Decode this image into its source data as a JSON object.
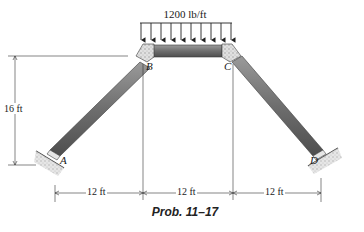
{
  "diagram": {
    "load": {
      "label": "1200 lb/ft",
      "arrow_count": 10
    },
    "points": {
      "A": "A",
      "B": "B",
      "C": "C",
      "D": "D"
    },
    "dimensions": {
      "height": "16 ft",
      "spans": [
        "12 ft",
        "12 ft",
        "12 ft"
      ]
    },
    "caption": "Prob. 11–17",
    "colors": {
      "member": "#7a7a7a",
      "member_dark": "#4a4a4a",
      "joint": "#c8c8c8",
      "ground": "#bdbdbd",
      "line": "#333333"
    }
  }
}
